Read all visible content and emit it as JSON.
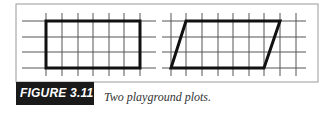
{
  "figure": {
    "label": "FIGURE 3.11",
    "caption": "Two playground plots."
  },
  "colors": {
    "frame": "#9a9a9a",
    "grid": "#555555",
    "shape": "#111111",
    "label_bg": "#1a1a1a",
    "label_text": "#ffffff"
  },
  "panels": [
    {
      "name": "rectangle-plot",
      "shape": "rectangle",
      "h_lines_y": [
        21,
        37,
        52,
        68
      ],
      "h_line_x_range": [
        22,
        156
      ],
      "v_lines_x": [
        46,
        62,
        78,
        93,
        109,
        124,
        140
      ],
      "v_line_y_range": [
        13,
        76
      ],
      "polygon": [
        [
          46,
          21
        ],
        [
          140,
          21
        ],
        [
          140,
          68
        ],
        [
          46,
          68
        ]
      ]
    },
    {
      "name": "parallelogram-plot",
      "shape": "parallelogram",
      "h_lines_y": [
        21,
        37,
        52,
        68
      ],
      "h_line_x_range": [
        162,
        306
      ],
      "v_lines_x": [
        171,
        186,
        202,
        218,
        233,
        249,
        264,
        280,
        296
      ],
      "v_line_y_range": [
        13,
        76
      ],
      "polygon": [
        [
          186,
          21
        ],
        [
          280,
          21
        ],
        [
          264,
          68
        ],
        [
          171,
          68
        ]
      ]
    }
  ]
}
